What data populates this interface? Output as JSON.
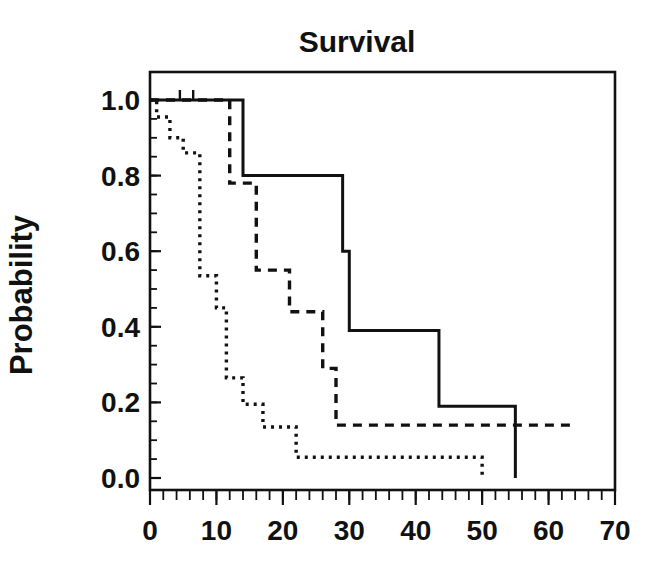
{
  "figure": {
    "title": "Survival",
    "ylabel": "Probability",
    "xlabel": ""
  },
  "axes": {
    "x_ticks": [
      "0",
      "10",
      "20",
      "30",
      "40",
      "50",
      "60",
      "70"
    ],
    "y_ticks": [
      "1.0",
      "0.8",
      "0.6",
      "0.4",
      "0.2",
      "0.0"
    ]
  },
  "chart_data": {
    "type": "line",
    "title": "Survival",
    "xlabel": "",
    "ylabel": "Probability",
    "xlim": [
      0,
      70
    ],
    "ylim": [
      0.0,
      1.0
    ],
    "x_ticks": [
      0,
      10,
      20,
      30,
      40,
      50,
      60,
      70
    ],
    "y_ticks": [
      0.0,
      0.2,
      0.4,
      0.6,
      0.8,
      1.0
    ],
    "x_minor_tick_step": 2,
    "y_minor_tick_step": 0.05,
    "grid": false,
    "legend": null,
    "legend_position": "none",
    "plot_style": "step-post Kaplan-Meier survival curves, black on white",
    "series": [
      {
        "name": "curve-1-solid",
        "style": "solid",
        "censor_marks_t": [
          4.5,
          6.5
        ],
        "points": [
          {
            "t": 0,
            "p": 1.0
          },
          {
            "t": 14,
            "p": 1.0
          },
          {
            "t": 14,
            "p": 0.8
          },
          {
            "t": 29,
            "p": 0.8
          },
          {
            "t": 29,
            "p": 0.6
          },
          {
            "t": 30,
            "p": 0.6
          },
          {
            "t": 30,
            "p": 0.39
          },
          {
            "t": 43.5,
            "p": 0.39
          },
          {
            "t": 43.5,
            "p": 0.19
          },
          {
            "t": 55,
            "p": 0.19
          },
          {
            "t": 55,
            "p": 0.0
          }
        ]
      },
      {
        "name": "curve-2-dashed",
        "style": "dashed",
        "censor_marks_t": [],
        "points": [
          {
            "t": 0,
            "p": 1.0
          },
          {
            "t": 12,
            "p": 1.0
          },
          {
            "t": 12,
            "p": 0.78
          },
          {
            "t": 16,
            "p": 0.78
          },
          {
            "t": 16,
            "p": 0.55
          },
          {
            "t": 21,
            "p": 0.55
          },
          {
            "t": 21,
            "p": 0.44
          },
          {
            "t": 26,
            "p": 0.44
          },
          {
            "t": 26,
            "p": 0.29
          },
          {
            "t": 28,
            "p": 0.29
          },
          {
            "t": 28,
            "p": 0.14
          },
          {
            "t": 64,
            "p": 0.14
          }
        ]
      },
      {
        "name": "curve-3-dotted",
        "style": "dotted",
        "censor_marks_t": [],
        "points": [
          {
            "t": 0,
            "p": 1.0
          },
          {
            "t": 1,
            "p": 1.0
          },
          {
            "t": 1,
            "p": 0.955
          },
          {
            "t": 3,
            "p": 0.955
          },
          {
            "t": 3,
            "p": 0.9
          },
          {
            "t": 5,
            "p": 0.9
          },
          {
            "t": 5,
            "p": 0.86
          },
          {
            "t": 7.5,
            "p": 0.86
          },
          {
            "t": 7.5,
            "p": 0.535
          },
          {
            "t": 10,
            "p": 0.535
          },
          {
            "t": 10,
            "p": 0.45
          },
          {
            "t": 11.5,
            "p": 0.45
          },
          {
            "t": 11.5,
            "p": 0.265
          },
          {
            "t": 14,
            "p": 0.265
          },
          {
            "t": 14,
            "p": 0.195
          },
          {
            "t": 17,
            "p": 0.195
          },
          {
            "t": 17,
            "p": 0.135
          },
          {
            "t": 22,
            "p": 0.135
          },
          {
            "t": 22,
            "p": 0.055
          },
          {
            "t": 50,
            "p": 0.055
          },
          {
            "t": 50,
            "p": 0.0
          }
        ]
      }
    ]
  }
}
